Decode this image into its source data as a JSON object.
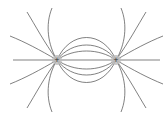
{
  "diagram": {
    "type": "electric-field-lines",
    "charges": [
      {
        "id": "left",
        "sign": "+",
        "x": 57,
        "y": 60
      },
      {
        "id": "right",
        "sign": "+",
        "x": 116,
        "y": 60
      }
    ],
    "colors": {
      "line": "#4a4a4a",
      "charge_fill": "#bdbdbd",
      "background": "#ffffff"
    }
  }
}
